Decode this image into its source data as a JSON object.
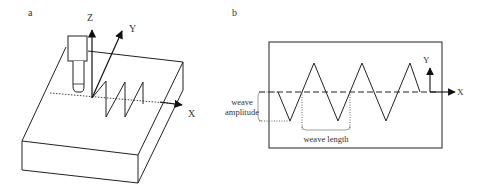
{
  "panel_a": {
    "label": "a",
    "axes": {
      "z": "Z",
      "y": "Y",
      "x": "X"
    },
    "elements": [
      "workpiece-block",
      "welding-torch",
      "zigzag-weave-path",
      "dotted-path-line"
    ]
  },
  "panel_b": {
    "label": "b",
    "axes": {
      "y": "Y",
      "x": "X"
    },
    "weave_amplitude_label_line1": "weave",
    "weave_amplitude_label_line2": "amplitude",
    "weave_length_label": "weave length"
  },
  "colors": {
    "line": "#222222",
    "text": "#333333",
    "dotted": "#666666"
  }
}
